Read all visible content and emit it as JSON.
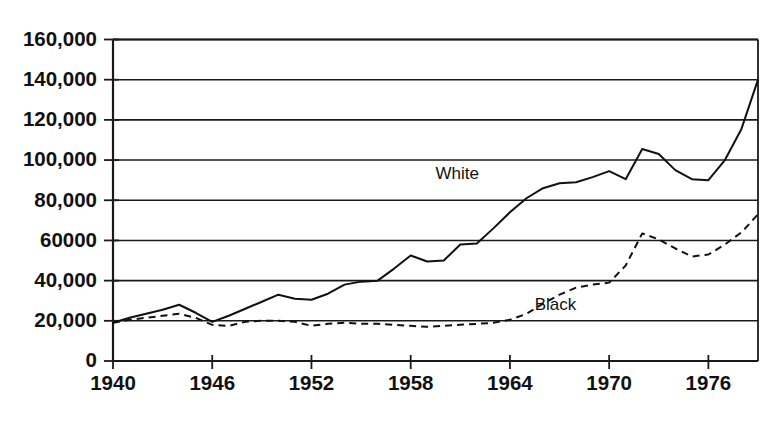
{
  "chart_data": {
    "type": "line",
    "title": "",
    "subtitle": "",
    "xlabel": "",
    "ylabel": "",
    "xlim": [
      1940,
      1979
    ],
    "ylim": [
      0,
      160000
    ],
    "grid": true,
    "grid_axis": "y",
    "legend_position": "inline-annotation",
    "x_tick_labels": [
      "1940",
      "1946",
      "1952",
      "1958",
      "1964",
      "1970",
      "1976"
    ],
    "x_ticks": [
      1940,
      1946,
      1952,
      1958,
      1964,
      1970,
      1976
    ],
    "y_tick_labels": [
      "0",
      "20,000",
      "40,000",
      "60000",
      "80,000",
      "100,000",
      "120,000",
      "140,000",
      "160,000"
    ],
    "y_ticks": [
      0,
      20000,
      40000,
      60000,
      80000,
      100000,
      120000,
      140000,
      160000
    ],
    "x": [
      1940,
      1941,
      1942,
      1943,
      1944,
      1945,
      1946,
      1947,
      1948,
      1949,
      1950,
      1951,
      1952,
      1953,
      1954,
      1955,
      1956,
      1957,
      1958,
      1959,
      1960,
      1961,
      1962,
      1963,
      1964,
      1965,
      1966,
      1967,
      1968,
      1969,
      1970,
      1971,
      1972,
      1973,
      1974,
      1975,
      1976,
      1977,
      1978,
      1979
    ],
    "series": [
      {
        "name": "White",
        "style": "solid",
        "label": "White",
        "values": [
          19000,
          21500,
          23500,
          25500,
          28000,
          24000,
          19500,
          22500,
          26000,
          29500,
          33000,
          31000,
          30500,
          33500,
          38000,
          39500,
          40000,
          46000,
          52500,
          49500,
          50000,
          58000,
          58500,
          66000,
          74000,
          81000,
          86000,
          88500,
          89000,
          91500,
          94500,
          90500,
          105500,
          103000,
          95000,
          90500,
          90000,
          100000,
          115500,
          140000
        ]
      },
      {
        "name": "Black",
        "style": "dashed",
        "label": "Black",
        "values": [
          19000,
          20500,
          21500,
          22500,
          23500,
          21500,
          18000,
          17500,
          19500,
          20000,
          20000,
          19500,
          17500,
          18500,
          19000,
          18500,
          18500,
          18000,
          17500,
          17000,
          17500,
          18000,
          18500,
          19000,
          20500,
          23500,
          28500,
          33000,
          36500,
          38000,
          39000,
          47500,
          63500,
          60500,
          56000,
          52000,
          53000,
          58000,
          64000,
          73000
        ]
      }
    ],
    "annotations": [
      {
        "text": "White",
        "x": 1959.5,
        "y": 93000
      },
      {
        "text": "Black",
        "x": 1965.5,
        "y": 27500
      }
    ]
  }
}
